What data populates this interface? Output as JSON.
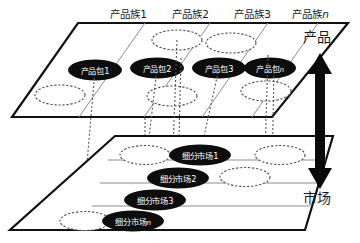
{
  "diagram": {
    "type": "layered-matrix-diagram",
    "colors": {
      "plane_outline": "#111111",
      "plane_fill": "#ffffff",
      "grid_line": "#8c8c8c",
      "node_fill": "#0d0d0d",
      "node_text": "#ffffff",
      "dashed_node_stroke": "#4d4d4d",
      "connector": "#555555",
      "arrow": "#0a0a0a",
      "label_text": "#1a1a1a",
      "background": "#ffffff"
    }
  },
  "top_plane": {
    "name": "product-plane",
    "column_labels": [
      {
        "text": "产品族",
        "index": "1"
      },
      {
        "text": "产品族",
        "index": "2"
      },
      {
        "text": "产品族",
        "index": "3"
      },
      {
        "text": "产品族",
        "index": "n"
      }
    ],
    "nodes": [
      {
        "text": "产品包",
        "index": "1",
        "cx": 95,
        "cy": 70,
        "rx": 27,
        "ry": 10.5,
        "filled": true
      },
      {
        "text": "产品包",
        "index": "2",
        "cx": 157,
        "cy": 68,
        "rx": 27,
        "ry": 10.5,
        "filled": true
      },
      {
        "text": "产品包",
        "index": "3",
        "cx": 219,
        "cy": 68,
        "rx": 27,
        "ry": 10.5,
        "filled": true
      },
      {
        "text": "产品包",
        "index": "n",
        "cx": 270,
        "cy": 68,
        "rx": 26,
        "ry": 10.5,
        "filled": true
      }
    ],
    "empty_nodes": [
      {
        "cx": 60,
        "cy": 95,
        "rx": 25,
        "ry": 10
      },
      {
        "cx": 177,
        "cy": 40,
        "rx": 25,
        "ry": 10
      },
      {
        "cx": 231,
        "cy": 43,
        "rx": 25,
        "ry": 10
      },
      {
        "cx": 172,
        "cy": 96,
        "rx": 25,
        "ry": 10
      },
      {
        "cx": 266,
        "cy": 91,
        "rx": 25,
        "ry": 10
      }
    ]
  },
  "bottom_plane": {
    "name": "market-plane",
    "nodes": [
      {
        "text": "细分市场",
        "index": "1",
        "cx": 200,
        "cy": 155,
        "rx": 31,
        "ry": 10.5,
        "filled": true
      },
      {
        "text": "细分市场",
        "index": "2",
        "cx": 178,
        "cy": 178,
        "rx": 31,
        "ry": 10.5,
        "filled": true
      },
      {
        "text": "细分市场",
        "index": "3",
        "cx": 155,
        "cy": 200,
        "rx": 31,
        "ry": 10.5,
        "filled": true
      },
      {
        "text": "细分市场",
        "index": "n",
        "cx": 133,
        "cy": 221,
        "rx": 31,
        "ry": 10.5,
        "filled": true
      }
    ],
    "empty_nodes": [
      {
        "cx": 145,
        "cy": 155,
        "rx": 25,
        "ry": 9.5
      },
      {
        "cx": 280,
        "cy": 155,
        "rx": 25,
        "ry": 9.5
      },
      {
        "cx": 245,
        "cy": 177,
        "rx": 25,
        "ry": 9.5
      },
      {
        "cx": 85,
        "cy": 221,
        "rx": 25,
        "ry": 9.5
      }
    ]
  },
  "axis": {
    "top_label": "产品",
    "bottom_label": "市场",
    "arrow_name": "product-market-double-arrow"
  },
  "connectors": [
    {
      "x_top": 95,
      "x_bottom": 82,
      "from": "产品包1",
      "to": "细分市场n"
    },
    {
      "x_top": 157,
      "x_bottom": 142,
      "from": "产品包2",
      "to": "细分市场/空"
    },
    {
      "x_top": 177,
      "x_bottom": 172,
      "from": "空白包",
      "to": "细分市场1"
    },
    {
      "x_top": 180,
      "x_bottom": 178,
      "from": "空白包",
      "to": "细分市场1"
    },
    {
      "x_top": 219,
      "x_bottom": 200,
      "from": "产品包3",
      "to": "细分市场1"
    },
    {
      "x_top": 270,
      "x_bottom": 265,
      "from": "产品包n",
      "to": "空白市场"
    },
    {
      "x_top": 274,
      "x_bottom": 272,
      "from": "产品包n",
      "to": "空白市场"
    }
  ]
}
